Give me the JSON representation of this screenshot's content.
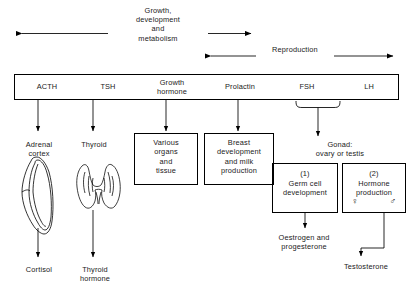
{
  "diagram": {
    "top_arrows": [
      {
        "label": "Growth,\ndevelopment\nand\nmetabolism",
        "name": "growth-development-metabolism-arrow"
      },
      {
        "label": "Reproduction",
        "name": "reproduction-arrow"
      }
    ],
    "hormones": [
      {
        "label": "ACTH"
      },
      {
        "label": "TSH"
      },
      {
        "label": "Growth\nhormone"
      },
      {
        "label": "Prolactin"
      },
      {
        "label": "FSH"
      },
      {
        "label": "LH"
      }
    ],
    "targets": [
      {
        "label": "Adrenal\ncortex",
        "boxed": false
      },
      {
        "label": "Thyroid",
        "boxed": false
      },
      {
        "label": "Various\norgans\nand\ntissue",
        "boxed": true
      },
      {
        "label": "Breast\ndevelopment\nand milk\nproduction",
        "boxed": true
      },
      {
        "label": "Gonad:\novary or testis",
        "boxed": false
      }
    ],
    "gonad_functions": [
      {
        "number": "(1)",
        "label": "Germ cell\ndevelopment",
        "symbols": []
      },
      {
        "number": "(2)",
        "label": "Hormone\nproduction",
        "symbols": [
          "♀",
          "♂"
        ]
      }
    ],
    "outputs": [
      {
        "label": "Cortisol"
      },
      {
        "label": "Thyroid\nhormone"
      },
      {
        "label": "Oestrogen and\nprogesterone"
      },
      {
        "label": "Testosterone"
      }
    ],
    "organ_illustrations": [
      {
        "name": "adrenal-cortex-illustration"
      },
      {
        "name": "thyroid-gland-illustration"
      }
    ],
    "colors": {
      "ink": "#1a1a1a",
      "line": "#000000",
      "background": "#ffffff"
    }
  }
}
